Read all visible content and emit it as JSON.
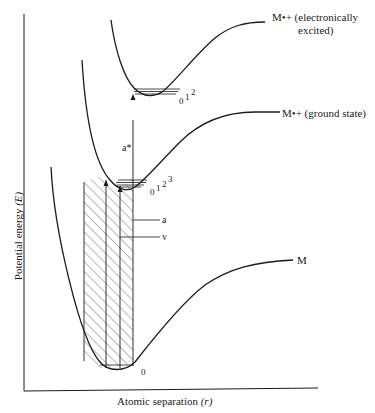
{
  "diagram": {
    "type": "potential-energy-curves",
    "axes": {
      "y_label": "Potential energy (E)",
      "y_label_text": "Potential energy ",
      "y_label_symbol": "(E)",
      "x_label_text": "Atomic separation ",
      "x_label_symbol": "(r)"
    },
    "curves": [
      {
        "id": "M-excited",
        "label_line1": "M•+ (electronically",
        "label_line2": "excited)",
        "vibrational_levels": [
          "0",
          "1",
          "2"
        ]
      },
      {
        "id": "M-ground-ion",
        "label": "M•+ (ground state)",
        "vibrational_levels": [
          "0",
          "1",
          "2",
          "3"
        ]
      },
      {
        "id": "M-neutral",
        "label": "M",
        "vibrational_levels": [
          "0"
        ]
      }
    ],
    "transitions": [
      {
        "id": "a-star",
        "label": "a*"
      },
      {
        "id": "a",
        "label": "a"
      },
      {
        "id": "v",
        "label": "v"
      }
    ],
    "level_labels": {
      "excited": "012",
      "excited_0": "0",
      "excited_1": "1",
      "excited_2": "2",
      "ion_0": "0",
      "ion_1": "1",
      "ion_2": "2",
      "ion_3": "3",
      "neutral_0": "0"
    },
    "colors": {
      "line": "#1a1a1a",
      "background": "#ffffff"
    }
  }
}
